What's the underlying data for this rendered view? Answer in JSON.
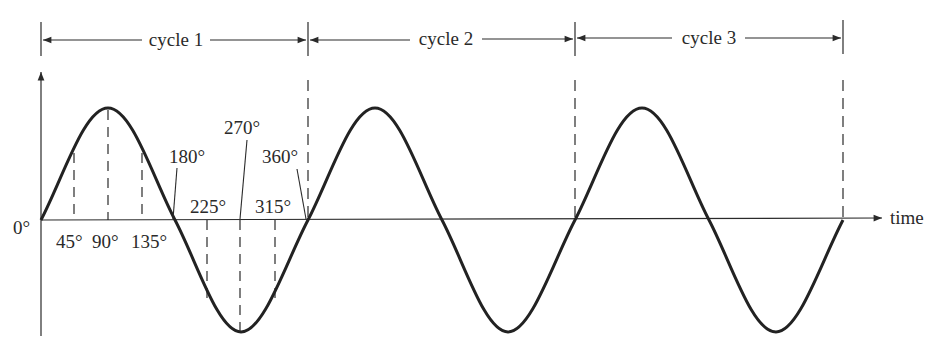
{
  "diagram": {
    "colors": {
      "ink": "#2a2a2a",
      "background": "#ffffff"
    },
    "geometry": {
      "origin_x": 41,
      "baseline_y": 220,
      "cycle_width": 267.3,
      "peak_y": 108,
      "trough_y": 332
    },
    "cycles": [
      {
        "label": "cycle 1",
        "start_x": 41,
        "end_x": 308
      },
      {
        "label": "cycle 2",
        "start_x": 308,
        "end_x": 575
      },
      {
        "label": "cycle 3",
        "start_x": 575,
        "end_x": 843
      }
    ],
    "axis": {
      "origin_label": "0°",
      "x_label": "time"
    },
    "angle_labels": [
      {
        "deg": 45,
        "text": "45°"
      },
      {
        "deg": 90,
        "text": "90°"
      },
      {
        "deg": 135,
        "text": "135°"
      },
      {
        "deg": 180,
        "text": "180°"
      },
      {
        "deg": 225,
        "text": "225°"
      },
      {
        "deg": 270,
        "text": "270°"
      },
      {
        "deg": 315,
        "text": "315°"
      },
      {
        "deg": 360,
        "text": "360°"
      }
    ]
  }
}
